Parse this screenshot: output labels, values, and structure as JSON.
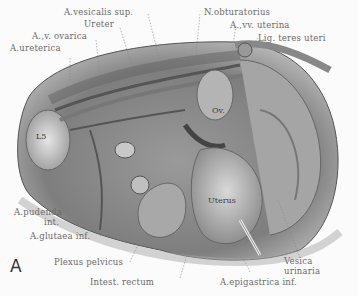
{
  "figure": {
    "panel_letter": "A"
  },
  "labels": {
    "a_vesicalis_sup": "A.vesicalis sup.",
    "ureter": "Ureter",
    "a_v_ovarica": "A.,v. ovarica",
    "a_ureterica": "A.ureterica",
    "n_obturatorius": "N.obturatorius",
    "a_vv_uterina": "A.,vv. uterina",
    "lig_teres_uteri": "Lig. teres uteri",
    "a_pudenda_line1": "A.pudenda",
    "a_pudenda_line2": "int.",
    "a_glutaea_inf": "A.glutaea inf.",
    "plexus_pelvicus": "Plexus pelvicus",
    "intest_rectum": "Intest. rectum",
    "a_epigastrica_inf": "A.epigastrica inf.",
    "vesica_line1": "Vesica",
    "vesica_line2": "urinaria"
  },
  "inner_labels": {
    "l5": "L5",
    "ovary": "Ov.",
    "uterus": "Uterus"
  }
}
